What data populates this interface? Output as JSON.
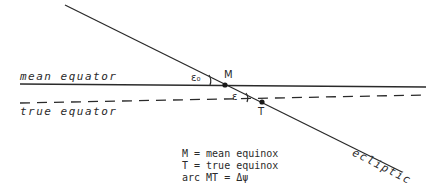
{
  "diagram": {
    "lines": {
      "ecliptic": {
        "label": "ecliptic",
        "style": "solid"
      },
      "mean_equator": {
        "label": "mean equator",
        "style": "solid"
      },
      "true_equator": {
        "label": "true equator",
        "style": "dashed"
      }
    },
    "points": {
      "M": {
        "label": "M"
      },
      "T": {
        "label": "T"
      }
    },
    "angles": {
      "mean_obliquity": {
        "label": "ε₀"
      },
      "true_obliquity": {
        "label": "ε"
      }
    },
    "legend": [
      "M = mean equinox",
      "T = true equinox",
      "arc MT = Δψ"
    ],
    "colors": {
      "line": "#2a2a2a",
      "background": "#ffffff"
    }
  }
}
